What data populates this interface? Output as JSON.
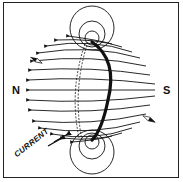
{
  "diagram": {
    "labels": {
      "north": "N",
      "south": "S",
      "current": "CURRENT"
    },
    "colors": {
      "ink": "#111111",
      "background": "#ffffff"
    },
    "elements": [
      "wire-loop",
      "field-lines",
      "circular-field-top",
      "circular-field-bottom",
      "compass-needle-left",
      "compass-needle-right",
      "current-arrows"
    ]
  }
}
